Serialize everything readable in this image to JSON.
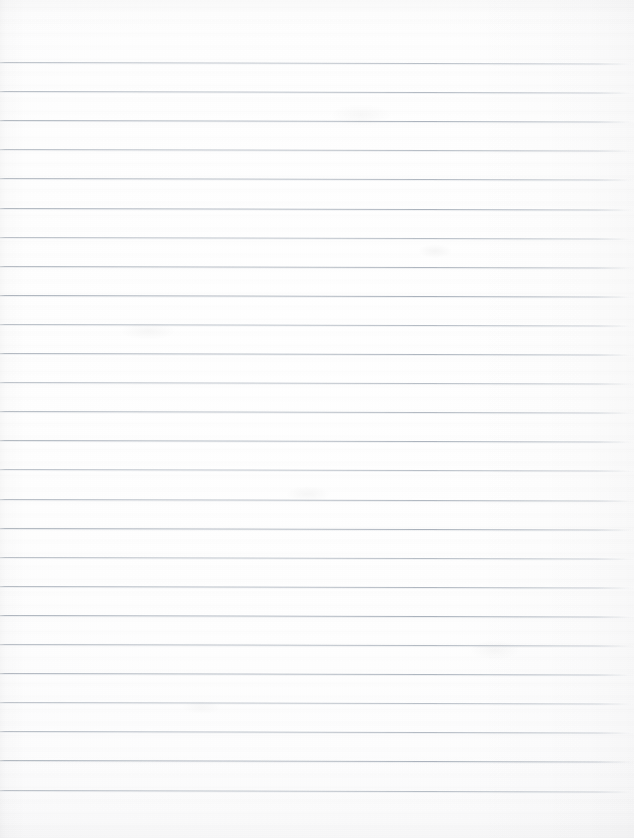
{
  "document": {
    "kind": "scanned-lined-paper",
    "description": "Blank scanned sheet of ruled notebook paper",
    "page_label": "",
    "text_content": "",
    "has_writing": false,
    "orientation": "portrait",
    "width_px": 634,
    "height_px": 838
  },
  "paper": {
    "background_color": "#fdfdfe",
    "paper_tone_center": "#ffffff",
    "paper_tone_edge": "#f2f3f5",
    "edge_shadow_color": "#e9eaec"
  },
  "ruling": {
    "line_color": "#aab0ba",
    "line_highlight_color": "#ffffff",
    "line_bleed_color": "#c4cad2",
    "line_thickness_px": 1,
    "line_pitch_px": 29.1,
    "first_line_y_px": 62,
    "line_count": 26,
    "tilt_degrees": 0.13,
    "left_inset_px": 0,
    "right_fade_start_px": 596,
    "line_y_positions": [
      62,
      91.1,
      120.2,
      149.3,
      178.4,
      207.5,
      236.6,
      265.7,
      294.8,
      323.9,
      353,
      382.1,
      411.2,
      440.3,
      469.4,
      498.5,
      527.6,
      556.7,
      585.8,
      614.9,
      644,
      673.1,
      702.2,
      731.3,
      760.4,
      789.5
    ]
  },
  "blotches": [
    {
      "left": 418,
      "top": 244,
      "width": 34,
      "height": 14,
      "opacity": 0.035
    },
    {
      "left": 120,
      "top": 322,
      "width": 56,
      "height": 18,
      "opacity": 0.028
    },
    {
      "left": 286,
      "top": 486,
      "width": 44,
      "height": 16,
      "opacity": 0.03
    },
    {
      "left": 470,
      "top": 640,
      "width": 50,
      "height": 20,
      "opacity": 0.026
    },
    {
      "left": 182,
      "top": 700,
      "width": 40,
      "height": 14,
      "opacity": 0.024
    },
    {
      "left": 330,
      "top": 104,
      "width": 62,
      "height": 22,
      "opacity": 0.022
    }
  ]
}
